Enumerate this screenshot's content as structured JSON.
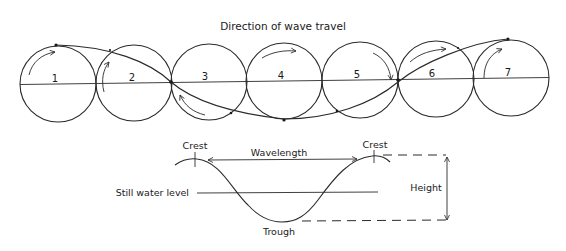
{
  "title": "Direction of wave travel",
  "orbits": {
    "axis_y": 82,
    "circles": [
      {
        "label": "1",
        "cx": 58,
        "cy": 84,
        "r": 38,
        "label_x": 55,
        "label_y": 82
      },
      {
        "label": "2",
        "cx": 134,
        "cy": 83,
        "r": 38,
        "label_x": 132,
        "label_y": 81
      },
      {
        "label": "3",
        "cx": 209,
        "cy": 82,
        "r": 38,
        "label_x": 205,
        "label_y": 80
      },
      {
        "label": "4",
        "cx": 284,
        "cy": 81,
        "r": 38,
        "label_x": 281,
        "label_y": 79
      },
      {
        "label": "5",
        "cx": 360,
        "cy": 80,
        "r": 38,
        "label_x": 357,
        "label_y": 78
      },
      {
        "label": "6",
        "cx": 436,
        "cy": 79,
        "r": 38,
        "label_x": 432,
        "label_y": 77
      },
      {
        "label": "7",
        "cx": 511,
        "cy": 78,
        "r": 38,
        "label_x": 508,
        "label_y": 76
      }
    ]
  },
  "wave_profile": {
    "labels": {
      "crest_left": "Crest",
      "crest_right": "Crest",
      "wavelength": "Wavelength",
      "still_water_level": "Still water level",
      "trough": "Trough",
      "height": "Height"
    }
  },
  "colors": {
    "background": "#ffffff",
    "ink": "#2a2a2a"
  }
}
